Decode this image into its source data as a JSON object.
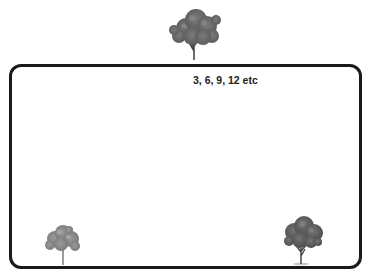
{
  "diagram": {
    "boundary": {
      "shape": "rounded-rectangle",
      "border_color": "#1a1a1a"
    },
    "label": "3, 6, 9, 12 etc",
    "trees": [
      {
        "id": "tree-top-center",
        "position": "above-top-edge-center",
        "color": "#6b6b6b"
      },
      {
        "id": "tree-bottom-left",
        "position": "inside-bottom-left",
        "color": "#8a8a8a"
      },
      {
        "id": "tree-bottom-right",
        "position": "inside-bottom-right",
        "color": "#5a5a5a"
      }
    ]
  }
}
